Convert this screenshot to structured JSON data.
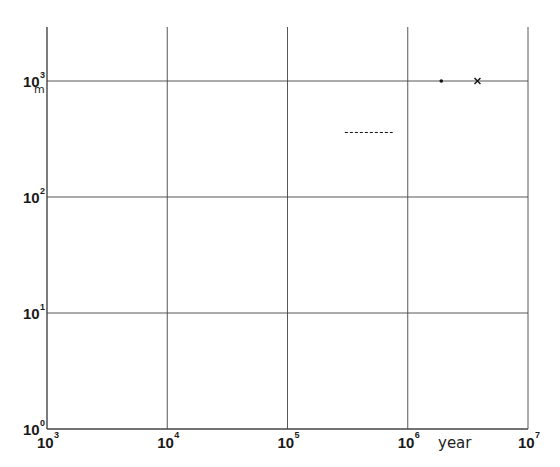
{
  "chart_data": {
    "type": "scatter",
    "title": "",
    "xlabel": "year",
    "ylabel": "m",
    "x_scale": "log",
    "y_scale": "log",
    "xlim": [
      1000,
      10000000
    ],
    "ylim": [
      1,
      2000
    ],
    "grid": true,
    "x_ticks": [
      {
        "base": "10",
        "exp": "3",
        "value": 1000
      },
      {
        "base": "10",
        "exp": "4",
        "value": 10000
      },
      {
        "base": "10",
        "exp": "5",
        "value": 100000
      },
      {
        "base": "10",
        "exp": "6",
        "value": 1000000
      },
      {
        "base": "10",
        "exp": "7",
        "value": 10000000
      }
    ],
    "y_ticks": [
      {
        "base": "10",
        "exp": "0",
        "value": 1
      },
      {
        "base": "10",
        "exp": "1",
        "value": 10
      },
      {
        "base": "10",
        "exp": "2",
        "value": 100
      },
      {
        "base": "10",
        "exp": "3",
        "value": 1000
      }
    ],
    "series": [
      {
        "name": "dot",
        "marker": "dot",
        "points": [
          {
            "x": 1900000,
            "y": 1000
          }
        ]
      },
      {
        "name": "cross",
        "marker": "x",
        "points": [
          {
            "x": 3800000,
            "y": 1000
          }
        ]
      },
      {
        "name": "dashed-segment",
        "marker": "dashed-line",
        "points": [
          {
            "x": 300000,
            "y": 360
          },
          {
            "x": 750000,
            "y": 360
          }
        ]
      }
    ],
    "legend": null
  },
  "colors": {
    "axis": "#1a1a1a",
    "grid": "#444444",
    "marker": "#111111"
  }
}
